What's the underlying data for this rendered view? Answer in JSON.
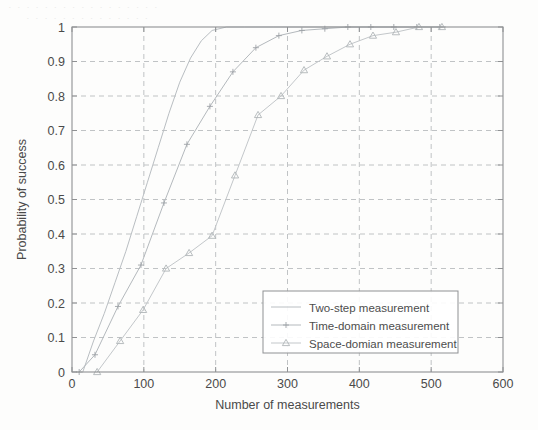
{
  "figure": {
    "background_color": "#fdfdfc",
    "axis_color": "#8f9193",
    "grid_color": "#b9bcbe",
    "paper_bleed_line_1": "· · · · · · · · · · · · · · · · ·",
    "paper_bleed_line_2": "· · · · · · · · · · · · · ·"
  },
  "chart_data": {
    "type": "line",
    "title": "",
    "xlabel": "Number of measurements",
    "ylabel": "Probability of success",
    "xlim": [
      0,
      600
    ],
    "ylim": [
      0,
      1
    ],
    "xticks": [
      0,
      100,
      200,
      300,
      400,
      500,
      600
    ],
    "xticklabels": [
      "0",
      "100",
      "200",
      "300",
      "400",
      "500",
      "600"
    ],
    "yticks": [
      0,
      0.1,
      0.2,
      0.3,
      0.4,
      0.5,
      0.6,
      0.7,
      0.8,
      0.9,
      1
    ],
    "yticklabels": [
      "0",
      "0.1",
      "0.2",
      "0.3",
      "0.4",
      "0.5",
      "0.6",
      "0.7",
      "0.8",
      "0.9",
      "1"
    ],
    "grid": true,
    "grid_style": "dashed",
    "legend_position": "lower right",
    "series": [
      {
        "name": "Two-step measurement",
        "color": "#b9bec2",
        "marker": "none",
        "linestyle": "solid",
        "x": [
          15,
          30,
          45,
          60,
          75,
          90,
          105,
          120,
          135,
          150,
          165,
          180,
          195,
          215,
          240,
          280,
          330,
          400,
          470,
          520
        ],
        "y": [
          0.0,
          0.09,
          0.17,
          0.26,
          0.35,
          0.45,
          0.55,
          0.65,
          0.75,
          0.84,
          0.91,
          0.96,
          0.99,
          1.0,
          1.0,
          1.0,
          1.0,
          1.0,
          1.0,
          1.0
        ]
      },
      {
        "name": "Time-domain measurement",
        "color": "#b4b9bd",
        "marker": "plus",
        "linestyle": "solid",
        "x": [
          10,
          32,
          64,
          96,
          128,
          160,
          192,
          224,
          256,
          288,
          320,
          352,
          384,
          416,
          448,
          480,
          512
        ],
        "y": [
          0.0,
          0.05,
          0.19,
          0.31,
          0.49,
          0.66,
          0.77,
          0.87,
          0.94,
          0.975,
          0.99,
          0.995,
          1.0,
          1.0,
          1.0,
          1.0,
          1.0
        ]
      },
      {
        "name": "Space-domian measurement",
        "color": "#c3c7ca",
        "marker": "triangle",
        "linestyle": "solid",
        "x": [
          35,
          67,
          99,
          131,
          163,
          195,
          227,
          259,
          291,
          323,
          355,
          387,
          419,
          451,
          483,
          515
        ],
        "y": [
          0.0,
          0.09,
          0.18,
          0.3,
          0.345,
          0.395,
          0.57,
          0.745,
          0.8,
          0.875,
          0.915,
          0.95,
          0.975,
          0.985,
          1.0,
          1.0
        ]
      }
    ]
  }
}
